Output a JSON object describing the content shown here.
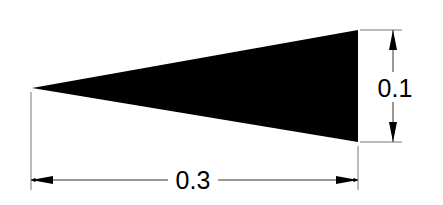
{
  "diagram": {
    "shape": "wedge-triangle",
    "fill_color": "#000000",
    "line_color": "#555555",
    "dimensions": {
      "length": {
        "label": "0.3"
      },
      "height": {
        "label": "0.1"
      }
    }
  }
}
